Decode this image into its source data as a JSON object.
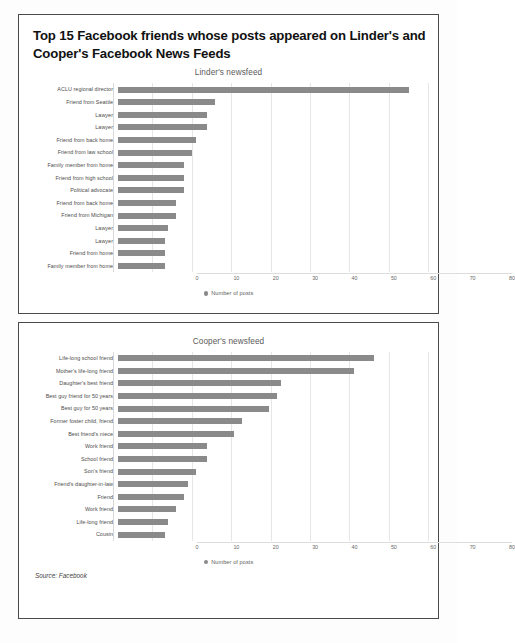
{
  "headline": "Top 15 Facebook friends whose posts appeared on Linder's and Cooper's Facebook News Feeds",
  "source_note": "Source: Facebook",
  "legend_label": "Number of posts",
  "charts": [
    {
      "title": "Linder's newsfeed",
      "legend_label": "Number of posts"
    },
    {
      "title": "Cooper's newsfeed",
      "legend_label": "Number of posts"
    }
  ],
  "chart_data": [
    {
      "type": "bar",
      "orientation": "horizontal",
      "title": "Linder's newsfeed",
      "xlabel": "",
      "ylabel": "",
      "xlim": [
        0,
        80
      ],
      "xticks": [
        0,
        10,
        20,
        30,
        40,
        50,
        60,
        70,
        80
      ],
      "grid": true,
      "legend": [
        "Number of posts"
      ],
      "legend_position": "bottom-center",
      "bar_color": "#8a8a8a",
      "categories": [
        "ACLU regional director",
        "Friend from Seattle",
        "Lawyer",
        "Lawyer",
        "Friend from back home",
        "Friend from law school",
        "Family member from home",
        "Friend from high school",
        "Political advocate",
        "Friend from back home",
        "Friend from Michigan",
        "Lawyer",
        "Lawyer",
        "Friend from home",
        "Family member from home"
      ],
      "values": [
        75,
        25,
        23,
        23,
        20,
        19,
        17,
        17,
        17,
        15,
        15,
        13,
        12,
        12,
        12
      ]
    },
    {
      "type": "bar",
      "orientation": "horizontal",
      "title": "Cooper's newsfeed",
      "xlabel": "",
      "ylabel": "",
      "xlim": [
        0,
        80
      ],
      "xticks": [
        0,
        10,
        20,
        30,
        40,
        50,
        60,
        70,
        80
      ],
      "grid": true,
      "legend": [
        "Number of posts"
      ],
      "legend_position": "bottom-center",
      "bar_color": "#8a8a8a",
      "categories": [
        "Life-long school friend",
        "Mother's life-long friend",
        "Daughter's best friend",
        "Best guy friend for 50 years",
        "Best guy for 50 years",
        "Former foster child, friend",
        "Best friend's niece",
        "Work friend",
        "School friend",
        "Son's friend",
        "Friend's daughter-in-law",
        "Friend",
        "Work friend",
        "Life-long friend",
        "Cousin"
      ],
      "values": [
        66,
        61,
        42,
        41,
        39,
        32,
        30,
        23,
        23,
        20,
        18,
        17,
        15,
        13,
        12
      ]
    }
  ]
}
